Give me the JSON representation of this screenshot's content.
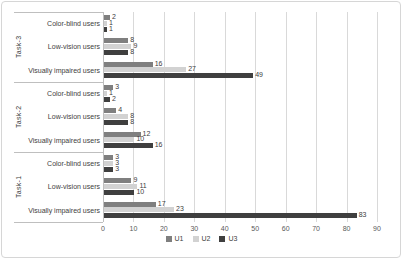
{
  "chart_data": {
    "type": "bar",
    "orientation": "horizontal",
    "title": "",
    "xlabel": "",
    "ylabel": "",
    "xlim": [
      0,
      90
    ],
    "xticks": [
      0,
      10,
      20,
      30,
      40,
      50,
      60,
      70,
      80,
      90
    ],
    "grid": true,
    "legend_position": "bottom",
    "series": [
      {
        "name": "U1",
        "color": "#7f7f7f"
      },
      {
        "name": "U2",
        "color": "#d2d2d2"
      },
      {
        "name": "U3",
        "color": "#3f3f3f"
      }
    ],
    "groups": [
      {
        "task": "Task-3",
        "rows": [
          {
            "category": "Color-blind users",
            "values": [
              2,
              1,
              1
            ]
          },
          {
            "category": "Low-vision users",
            "values": [
              8,
              9,
              8
            ]
          },
          {
            "category": "Visually impaired users",
            "values": [
              16,
              27,
              49
            ]
          }
        ]
      },
      {
        "task": "Task-2",
        "rows": [
          {
            "category": "Color-blind users",
            "values": [
              3,
              1,
              2
            ]
          },
          {
            "category": "Low-vision users",
            "values": [
              4,
              8,
              8
            ]
          },
          {
            "category": "Visually impaired users",
            "values": [
              12,
              10,
              16
            ]
          }
        ]
      },
      {
        "task": "Task-1",
        "rows": [
          {
            "category": "Color-blind users",
            "values": [
              3,
              3,
              3
            ]
          },
          {
            "category": "Low-vision users",
            "values": [
              9,
              11,
              10
            ]
          },
          {
            "category": "Visually impaired users",
            "values": [
              17,
              23,
              83
            ]
          }
        ]
      }
    ]
  }
}
